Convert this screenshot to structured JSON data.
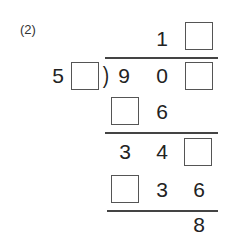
{
  "problem": {
    "label": "(2)",
    "quotient": {
      "digit1": "1",
      "digit2_blank": true
    },
    "divisor": {
      "digit1": "5",
      "digit2_blank": true
    },
    "bracket": ")",
    "dividend": {
      "digit1": "9",
      "digit2": "0",
      "digit3_blank": true
    },
    "step1": {
      "digit1_blank": true,
      "digit2": "6"
    },
    "step2": {
      "digit1": "3",
      "digit2": "4",
      "digit3_blank": true
    },
    "step3": {
      "digit1_blank": true,
      "digit2": "3",
      "digit3": "6"
    },
    "remainder": "8"
  }
}
